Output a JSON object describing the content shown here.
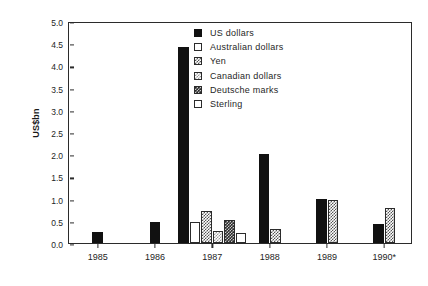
{
  "chart_data": {
    "type": "bar",
    "title": "",
    "subtitle": "",
    "xlabel": "",
    "ylabel": "US$bn",
    "ylim": [
      0.0,
      5.0
    ],
    "ytick_step": 0.5,
    "grid": false,
    "legend_position": "top-right",
    "categories": [
      "1985",
      "1986",
      "1987",
      "1988",
      "1989",
      "1990*"
    ],
    "ytick_labels": [
      "0.0",
      "0.5",
      "1.0",
      "1.5",
      "2.0",
      "2.5",
      "3.0",
      "3.5",
      "4.0",
      "4.5",
      "5.0"
    ],
    "series": [
      {
        "name": "US dollars",
        "fill": "solid",
        "values": [
          0.25,
          0.47,
          4.42,
          2.0,
          1.0,
          0.42
        ]
      },
      {
        "name": "Australian dollars",
        "fill": "open",
        "values": [
          null,
          null,
          0.47,
          null,
          null,
          null
        ]
      },
      {
        "name": "Yen",
        "fill": "mid",
        "values": [
          null,
          null,
          0.72,
          0.32,
          0.96,
          0.78
        ]
      },
      {
        "name": "Canadian dollars",
        "fill": "light",
        "values": [
          null,
          null,
          0.27,
          null,
          null,
          null
        ]
      },
      {
        "name": "Deutsche marks",
        "fill": "dark",
        "values": [
          null,
          null,
          0.52,
          null,
          null,
          null
        ]
      },
      {
        "name": "Sterling",
        "fill": "open",
        "values": [
          null,
          null,
          0.22,
          null,
          null,
          null
        ]
      }
    ]
  },
  "legend": {
    "items": [
      {
        "label": "US dollars",
        "fill": "solid"
      },
      {
        "label": "Australian dollars",
        "fill": "open"
      },
      {
        "label": "Yen",
        "fill": "mid"
      },
      {
        "label": "Canadian dollars",
        "fill": "light"
      },
      {
        "label": "Deutsche marks",
        "fill": "dark"
      },
      {
        "label": "Sterling",
        "fill": "open"
      }
    ]
  },
  "colors": {
    "axis": "#2b2b2b",
    "text": "#1f1f1f",
    "solid": "#111111",
    "background": "#ffffff"
  }
}
